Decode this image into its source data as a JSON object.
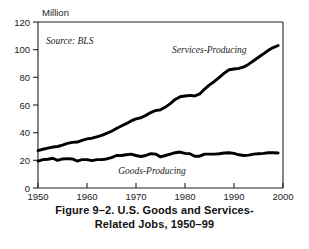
{
  "figure": {
    "caption_line1": "Figure 9–2.  U.S. Goods and Services-",
    "caption_line2": "Related Jobs, 1950–99"
  },
  "annotations": {
    "unit": "Million",
    "source": "Source: BLS",
    "series_label_services": "Services-Producing",
    "series_label_goods": "Goods-Producing"
  },
  "axis": {
    "y_ticks": [
      "0",
      "20",
      "40",
      "60",
      "80",
      "100",
      "120"
    ],
    "x_ticks": [
      "1950",
      "1960",
      "1970",
      "1980",
      "1990",
      "2000"
    ]
  },
  "colors": {
    "line": "#000000",
    "axis": "#222222",
    "background": "#ffffff",
    "text": "#1a1a1a"
  },
  "chart_data": {
    "type": "line",
    "subtitle": "",
    "xlabel": "",
    "ylabel": "Million",
    "xlim": [
      1950,
      2000
    ],
    "ylim": [
      0,
      120
    ],
    "grid": false,
    "legend": "inline-labels",
    "source": "Source: BLS",
    "x": [
      1950,
      1951,
      1952,
      1953,
      1954,
      1955,
      1956,
      1957,
      1958,
      1959,
      1960,
      1961,
      1962,
      1963,
      1964,
      1965,
      1966,
      1967,
      1968,
      1969,
      1970,
      1971,
      1972,
      1973,
      1974,
      1975,
      1976,
      1977,
      1978,
      1979,
      1980,
      1981,
      1982,
      1983,
      1984,
      1985,
      1986,
      1987,
      1988,
      1989,
      1990,
      1991,
      1992,
      1993,
      1994,
      1995,
      1996,
      1997,
      1998,
      1999
    ],
    "series": [
      {
        "name": "Services-Producing",
        "values": [
          27.0,
          28.0,
          28.8,
          29.6,
          30.0,
          31.0,
          32.2,
          33.0,
          33.2,
          34.5,
          35.5,
          36.0,
          37.0,
          38.0,
          39.5,
          41.0,
          43.0,
          44.8,
          46.5,
          48.5,
          50.0,
          50.8,
          52.5,
          54.5,
          56.0,
          56.5,
          58.5,
          61.0,
          64.0,
          66.0,
          66.5,
          67.0,
          66.5,
          68.0,
          71.5,
          74.5,
          77.0,
          80.0,
          83.0,
          85.5,
          86.0,
          86.5,
          87.5,
          89.5,
          92.0,
          94.5,
          97.0,
          99.5,
          101.5,
          103.0
        ]
      },
      {
        "name": "Goods-Producing",
        "values": [
          19.5,
          20.5,
          20.8,
          21.5,
          20.0,
          21.0,
          21.2,
          21.0,
          19.5,
          20.5,
          20.5,
          19.8,
          20.5,
          20.5,
          21.0,
          22.0,
          23.5,
          23.5,
          24.0,
          24.5,
          23.5,
          22.8,
          23.5,
          24.8,
          24.5,
          22.5,
          23.5,
          24.5,
          25.5,
          26.0,
          25.0,
          24.8,
          23.0,
          23.0,
          24.5,
          24.5,
          24.5,
          24.8,
          25.3,
          25.5,
          25.0,
          24.0,
          23.5,
          23.8,
          24.5,
          24.8,
          25.0,
          25.5,
          25.5,
          25.3
        ]
      }
    ]
  }
}
